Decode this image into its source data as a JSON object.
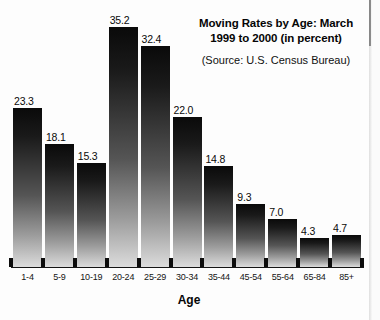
{
  "chart_data": {
    "type": "bar",
    "title": "Moving Rates by Age: March 1999 to 2000 (in percent)",
    "title_lines": [
      "Moving Rates by Age: March",
      "1999 to 2000 (in percent)"
    ],
    "source": "(Source: U.S. Census Bureau)",
    "xlabel": "Age",
    "ylabel": "",
    "ylim": [
      0,
      35.2
    ],
    "grid": false,
    "legend": false,
    "value_labels": true,
    "categories": [
      "1-4",
      "5-9",
      "10-19",
      "20-24",
      "25-29",
      "30-34",
      "35-44",
      "45-54",
      "55-64",
      "65-84",
      "85+"
    ],
    "values": [
      23.3,
      18.1,
      15.3,
      35.2,
      32.4,
      22.0,
      14.8,
      9.3,
      7.0,
      4.3,
      4.7
    ],
    "value_labels_text": [
      "23.3",
      "18.1",
      "15.3",
      "35.2",
      "32.4",
      "22.0",
      "14.8",
      "9.3",
      "7.0",
      "4.3",
      "4.7"
    ],
    "bar_color": "#1a1a1a",
    "bar_gradient_top": "#0a0a0a",
    "bar_gradient_bottom": "#dcdcdc",
    "axis_color": "#151515",
    "background": "#fdfdfd"
  }
}
